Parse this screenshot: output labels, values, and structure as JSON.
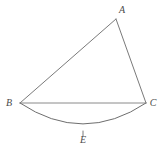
{
  "figure": {
    "type": "geometry-diagram",
    "background_color": "#ffffff",
    "width": 166,
    "height": 155,
    "stroke_color": "#7a7a7a",
    "chord_color": "#8a8a8a",
    "arc_color": "#6e6e6e",
    "label_color": "#4a4a4a",
    "stroke_width": 1,
    "points": [
      {
        "id": "A",
        "label": "A",
        "x": 116,
        "y": 19,
        "label_x": 119,
        "label_y": 11
      },
      {
        "id": "B",
        "label": "B",
        "x": 20,
        "y": 103,
        "label_x": 9,
        "label_y": 104
      },
      {
        "id": "C",
        "label": "C",
        "x": 146,
        "y": 103,
        "label_x": 153,
        "label_y": 104
      },
      {
        "id": "E",
        "label": "E",
        "x": 83,
        "y": 131,
        "label_x": 83,
        "label_y": 141
      }
    ],
    "segments": [
      {
        "id": "AB",
        "from": "A",
        "to": "B",
        "kind": "line"
      },
      {
        "id": "AC",
        "from": "A",
        "to": "C",
        "kind": "line"
      },
      {
        "id": "BC",
        "from": "B",
        "to": "C",
        "kind": "chord"
      }
    ],
    "arc": {
      "id": "BEC",
      "from": "B",
      "to": "C",
      "through": "E",
      "kind": "arc",
      "bulge_direction": "down",
      "path": "M 20 103 Q 83 145 146 103"
    },
    "tick": {
      "id": "E-tick",
      "x": 83,
      "y_start": 131,
      "y_end": 136
    }
  }
}
